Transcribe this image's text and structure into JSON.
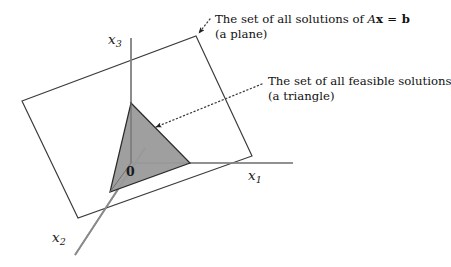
{
  "figure": {
    "background_color": "#ffffff"
  },
  "axes": {
    "x1": {
      "name": "x1-axis",
      "base": "x",
      "subscript": "1"
    },
    "x2": {
      "name": "x2-axis",
      "base": "x",
      "subscript": "2"
    },
    "x3": {
      "name": "x3-axis",
      "base": "x",
      "subscript": "3"
    },
    "line_color": "#808080"
  },
  "origin": {
    "label": "0"
  },
  "callouts": [
    {
      "id": "plane-callout",
      "line1_prefix": "The set of all solutions of ",
      "line1_math_A": "A",
      "line1_math_x": "x",
      "line1_math_eq": " = ",
      "line1_math_b": "b",
      "line2": "(a plane)",
      "target": "plane"
    },
    {
      "id": "triangle-callout",
      "line1": "The set of all feasible solutions",
      "line2": "(a triangle)",
      "target": "triangle"
    }
  ],
  "shapes": {
    "plane": {
      "name": "solution-plane",
      "description": "a plane",
      "fill": "#ffffff",
      "stroke": "#3a3a3a",
      "points": "22,101 196,36 252,156 78,218"
    },
    "triangle": {
      "name": "feasible-region-triangle",
      "description": "a triangle",
      "fill": "#9a9a9a",
      "stroke": "#2b2b2b",
      "points": "131,103 190,163 110,192"
    }
  },
  "colors": {
    "plane_fill": "#ffffff",
    "plane_stroke": "#3a3a3a",
    "triangle_fill": "#9a9a9a",
    "triangle_stroke": "#2b2b2b",
    "axis": "#808080",
    "dotted_leader": "#3a3a3a",
    "text": "#111111"
  }
}
